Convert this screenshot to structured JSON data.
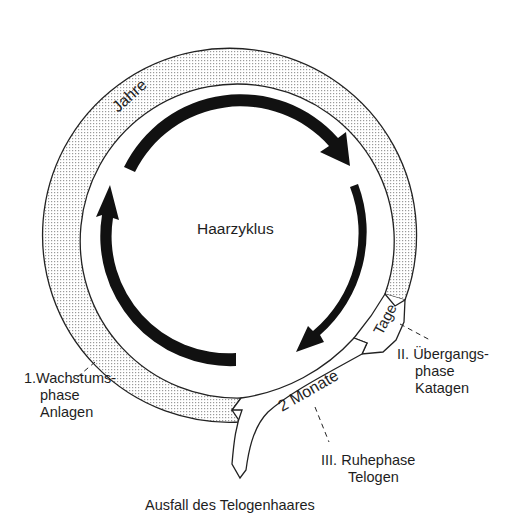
{
  "diagram": {
    "title": "Haarzyklus",
    "footer": "Ausfall des Telogenhaares",
    "durations": {
      "anagen": "Jahre",
      "katagen": "Tage",
      "telogen": "2 Monate"
    },
    "phases": [
      {
        "number": "1.",
        "name_line1": "Wachstums-",
        "name_line2": "phase",
        "latin": "Anlagen"
      },
      {
        "number": "II.",
        "name_line1": "Übergangs-",
        "name_line2": "phase",
        "latin": "Katagen"
      },
      {
        "number": "III.",
        "name_line1": "Ruhephase",
        "latin": "Telogen"
      }
    ],
    "colors": {
      "ink": "#1a1a1a",
      "band_fill": "#e4e4e4",
      "background": "#ffffff"
    }
  }
}
